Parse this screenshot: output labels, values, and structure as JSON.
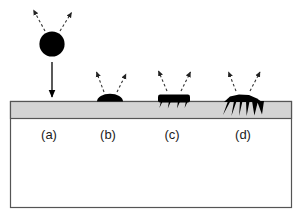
{
  "figure": {
    "type": "schematic-diagram",
    "canvas": {
      "width": 302,
      "height": 217,
      "background": "#ffffff"
    },
    "colors": {
      "outline": "#555555",
      "layer_fill": "#d4d4d4",
      "substrate_fill": "#ffffff",
      "particle_fill": "#000000",
      "arrow_solid": "#000000",
      "arrow_dashed": "#444444",
      "label_text": "#1b1b1b"
    },
    "frame": {
      "x": 10,
      "y": 101,
      "width": 282,
      "height": 107
    },
    "layer": {
      "name": "surface-layer",
      "x": 10,
      "y": 101,
      "width": 282,
      "height": 17,
      "fill": "#d4d4d4"
    },
    "substrate": {
      "name": "substrate-bulk",
      "x": 10,
      "y": 118,
      "width": 282,
      "height": 90,
      "fill": "#ffffff"
    },
    "stages": [
      {
        "id": "a",
        "label": "(a)",
        "label_x": 49,
        "label_y": 135,
        "description": "incident particle approaching surface",
        "particle": {
          "shape": "circle",
          "cx": 52,
          "cy": 44,
          "rx": 13,
          "ry": 12
        },
        "incident_arrow": {
          "x1": 52,
          "y1": 62,
          "x2": 52,
          "y2": 97,
          "style": "solid"
        },
        "emitted_arrows": [
          {
            "x1": 45,
            "y1": 31,
            "x2": 33,
            "y2": 9,
            "style": "dashed"
          },
          {
            "x1": 60,
            "y1": 31,
            "x2": 72,
            "y2": 12,
            "style": "dashed"
          }
        ]
      },
      {
        "id": "b",
        "label": "(b)",
        "label_x": 108,
        "label_y": 135,
        "description": "particle flattened into a dome on the surface",
        "particle": {
          "shape": "dome",
          "cx": 110,
          "base_y": 101,
          "rx": 13,
          "ry": 7
        },
        "emitted_arrows": [
          {
            "x1": 104,
            "y1": 92,
            "x2": 97,
            "y2": 72,
            "style": "dashed"
          },
          {
            "x1": 117,
            "y1": 92,
            "x2": 126,
            "y2": 74,
            "style": "dashed"
          }
        ]
      },
      {
        "id": "c",
        "label": "(c)",
        "label_x": 172,
        "label_y": 135,
        "description": "particle spread into a flat slab with short anchoring legs",
        "particle": {
          "shape": "slab-with-legs",
          "cx": 174,
          "base_y": 101,
          "half_width": 16,
          "height": 7,
          "legs": 4,
          "leg_depth": 7
        },
        "emitted_arrows": [
          {
            "x1": 167,
            "y1": 92,
            "x2": 159,
            "y2": 72,
            "style": "dashed"
          },
          {
            "x1": 181,
            "y1": 92,
            "x2": 190,
            "y2": 73,
            "style": "dashed"
          }
        ]
      },
      {
        "id": "d",
        "label": "(d)",
        "label_x": 243,
        "label_y": 135,
        "description": "particle penetrating with many long tendrils into the layer",
        "particle": {
          "shape": "spread-with-tendrils",
          "cx": 243,
          "base_y": 101,
          "half_width": 20,
          "height": 5,
          "legs": 7,
          "leg_depth": 14
        },
        "emitted_arrows": [
          {
            "x1": 236,
            "y1": 92,
            "x2": 229,
            "y2": 73,
            "style": "dashed"
          },
          {
            "x1": 250,
            "y1": 92,
            "x2": 260,
            "y2": 73,
            "style": "dashed"
          }
        ]
      }
    ]
  }
}
